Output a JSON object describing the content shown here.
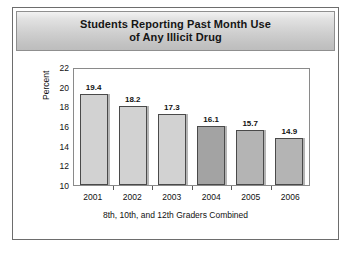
{
  "title": {
    "line1": "Students Reporting Past Month Use",
    "line2": "of Any Illicit Drug"
  },
  "chart_data": {
    "type": "bar",
    "title": "Students Reporting Past Month Use of Any Illicit Drug",
    "xlabel": "8th, 10th, and 12th Graders Combined",
    "ylabel": "Percent",
    "categories": [
      "2001",
      "2002",
      "2003",
      "2004",
      "2005",
      "2006"
    ],
    "values": [
      19.4,
      18.2,
      17.3,
      16.1,
      15.7,
      14.9
    ],
    "value_labels": [
      "19.4",
      "18.2",
      "17.3",
      "16.1",
      "15.7",
      "14.9"
    ],
    "ylim": [
      10,
      22
    ],
    "yticks": [
      "22",
      "20",
      "18",
      "16",
      "14",
      "12",
      "10"
    ],
    "ytick_values": [
      22,
      20,
      18,
      16,
      14,
      12,
      10
    ],
    "grid": false,
    "legend": "none",
    "bar_colors": [
      "#d2d2d2",
      "#d2d2d2",
      "#d2d2d2",
      "#a3a3a3",
      "#b4b4b4",
      "#b4b4b4"
    ]
  },
  "colors": {
    "bar_light": "#d2d2d2",
    "bar_dark": "#a3a3a3",
    "bar_medium": "#b4b4b4",
    "frame": "#6d6d6d",
    "banner_top": "#f2f2f2",
    "banner_bottom": "#bdbdbd"
  }
}
